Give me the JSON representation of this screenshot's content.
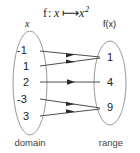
{
  "figure": {
    "title": {
      "function_name": "f",
      "colon": ":",
      "input_var": "x",
      "mapsto": "⟼",
      "output_expr_base": "x",
      "output_expr_exp": "2",
      "full": "f: x ⟼ x²"
    },
    "domain": {
      "header_label": "x",
      "caption": "domain",
      "elements": [
        "-1",
        "1",
        "2",
        "-3",
        "3"
      ]
    },
    "range": {
      "header_label": "f(x)",
      "caption": "range",
      "elements": [
        "1",
        "4",
        "9"
      ]
    },
    "mappings": [
      {
        "from": "-1",
        "to": "1"
      },
      {
        "from": "1",
        "to": "1"
      },
      {
        "from": "2",
        "to": "4"
      },
      {
        "from": "-3",
        "to": "9"
      },
      {
        "from": "3",
        "to": "9"
      }
    ],
    "colors": {
      "background": "#ffffff",
      "oval_stroke": "#9a9a9a",
      "arrow_stroke": "#3a3a3a",
      "text": "#1a1a1a",
      "caption_text": "#444444"
    }
  }
}
